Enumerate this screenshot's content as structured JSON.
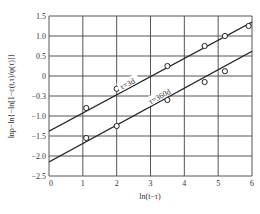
{
  "chart_data": {
    "type": "scatter",
    "title": "",
    "xlabel": "ln(t−τ)",
    "ylabel": "lnρ−ln{−ln[1−ε(t,τ)/φ(τ)]}",
    "xlim": [
      0,
      6
    ],
    "ylim": [
      -2.5,
      1.5
    ],
    "x_ticks": [
      "0",
      "1",
      "2",
      "3",
      "4",
      "5",
      "6"
    ],
    "y_ticks": [
      "1.5",
      "1.0",
      "0.5",
      "0",
      "−0.3",
      "−1.0",
      "−1.5",
      "−2.0",
      "−2.5"
    ],
    "grid": true,
    "legend": "none (inline line labels)",
    "series": [
      {
        "name": "τ=3d",
        "label": "τ=3d",
        "marker": "open-circle",
        "points": [
          [
            1.1,
            -0.8
          ],
          [
            2.0,
            -0.32
          ],
          [
            3.5,
            0.25
          ],
          [
            4.6,
            0.75
          ],
          [
            5.2,
            1.0
          ],
          [
            5.9,
            1.25
          ]
        ],
        "fit_line": {
          "x": [
            0,
            6
          ],
          "y": [
            -1.38,
            1.35
          ]
        }
      },
      {
        "name": "τ=360d",
        "label": "τ=360d",
        "marker": "open-circle",
        "points": [
          [
            1.1,
            -1.55
          ],
          [
            2.0,
            -1.25
          ],
          [
            3.5,
            -0.6
          ],
          [
            4.6,
            -0.15
          ],
          [
            5.2,
            0.12
          ]
        ],
        "fit_line": {
          "x": [
            0,
            6
          ],
          "y": [
            -2.15,
            0.62
          ]
        }
      }
    ]
  },
  "plot": {
    "left": 49,
    "top": 16,
    "right": 252,
    "bottom": 176,
    "line_color": "#222222",
    "grid_color": "#555555"
  }
}
